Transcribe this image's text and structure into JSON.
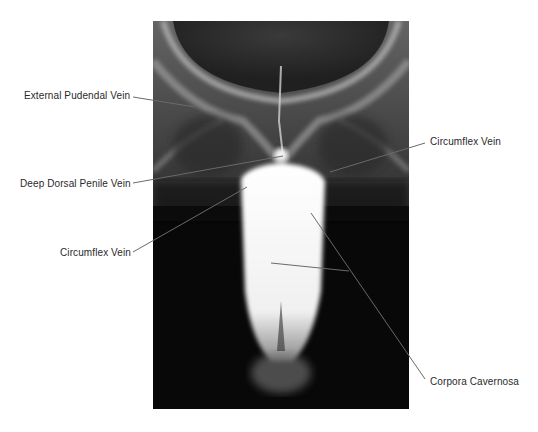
{
  "figure": {
    "image": {
      "description": "Cavernosogram X-ray showing contrast-filled corpora cavernosa below the pubic symphysis",
      "background_color": "#0a0a0a",
      "contrast_color": "#f7f7f7"
    },
    "labels": [
      {
        "id": "external-pudendal-vein",
        "text": "External Pudendal Vein",
        "side": "left"
      },
      {
        "id": "deep-dorsal-penile-vein",
        "text": "Deep Dorsal Penile Vein",
        "side": "left"
      },
      {
        "id": "circumflex-vein-left",
        "text": "Circumflex Vein",
        "side": "left"
      },
      {
        "id": "circumflex-vein-right",
        "text": "Circumflex Vein",
        "side": "right"
      },
      {
        "id": "corpora-cavernosa",
        "text": "Corpora Cavernosa",
        "side": "right"
      }
    ],
    "leader_line_color": "#555555",
    "label_color": "#2a2a2a"
  }
}
